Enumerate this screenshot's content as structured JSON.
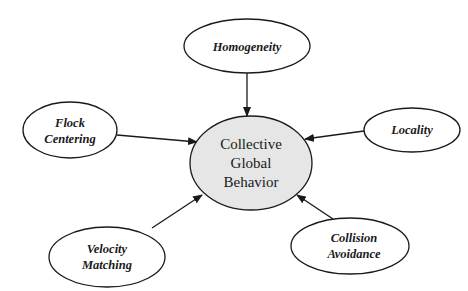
{
  "diagram": {
    "type": "concept-map",
    "center": {
      "id": "collective-global-behavior",
      "lines": [
        "Collective",
        "Global",
        "Behavior"
      ],
      "fill": "#e6e6e6"
    },
    "nodes": [
      {
        "id": "homogeneity",
        "lines": [
          "Homogeneity"
        ]
      },
      {
        "id": "flock-centering",
        "lines": [
          "Flock",
          "Centering"
        ]
      },
      {
        "id": "locality",
        "lines": [
          "Locality"
        ]
      },
      {
        "id": "velocity-matching",
        "lines": [
          "Velocity",
          "Matching"
        ]
      },
      {
        "id": "collision-avoidance",
        "lines": [
          "Collision",
          "Avoidance"
        ]
      }
    ],
    "edges": [
      {
        "from": "homogeneity",
        "to": "collective-global-behavior"
      },
      {
        "from": "flock-centering",
        "to": "collective-global-behavior"
      },
      {
        "from": "locality",
        "to": "collective-global-behavior"
      },
      {
        "from": "velocity-matching",
        "to": "collective-global-behavior"
      },
      {
        "from": "collision-avoidance",
        "to": "collective-global-behavior"
      }
    ]
  }
}
